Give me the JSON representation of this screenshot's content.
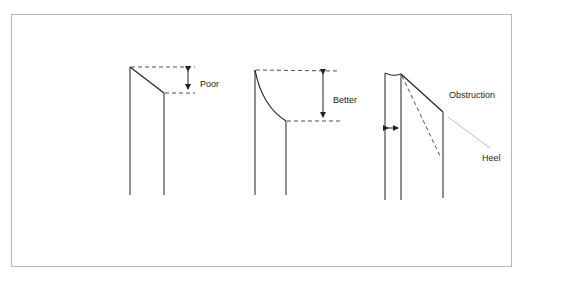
{
  "diagram": {
    "type": "needle-bevel-comparison",
    "panels": [
      {
        "id": "poor",
        "label": "Poor"
      },
      {
        "id": "better",
        "label": "Better"
      },
      {
        "id": "obstruction",
        "labels": {
          "obstruction": "Obstruction",
          "heel": "Heel"
        }
      }
    ]
  },
  "colors": {
    "line": "#222222",
    "leader": "#aaaaaa",
    "frame": "#b8b8b8"
  }
}
